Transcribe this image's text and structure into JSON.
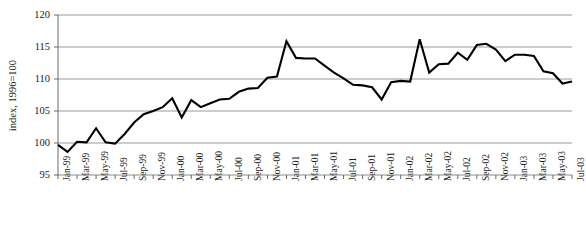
{
  "chart_data": {
    "type": "line",
    "title": "",
    "xlabel": "",
    "ylabel": "index, 1996=100",
    "ylim": [
      95,
      120
    ],
    "ytick_labels": [
      "120",
      "115",
      "110",
      "105",
      "100",
      "95"
    ],
    "ytick_values": [
      120,
      115,
      110,
      105,
      100,
      95
    ],
    "grid": true,
    "legend": "none",
    "x_tick_interval_months": 2,
    "x_tick_labels": [
      "Jan-99",
      "Mar-99",
      "May-99",
      "Jul-99",
      "Sep-99",
      "Nov-99",
      "Jan-00",
      "Mar-00",
      "May-00",
      "Jul-00",
      "Sep-00",
      "Nov-00",
      "Jan-01",
      "Mar-01",
      "May-01",
      "Jul-01",
      "Sep-01",
      "Nov-01",
      "Jan-02",
      "Mar-02",
      "May-02",
      "Jul-02",
      "Sep-02",
      "Nov-02",
      "Jan-03",
      "Mar-03",
      "May-03",
      "Jul-03"
    ],
    "x": [
      "Jan-99",
      "Feb-99",
      "Mar-99",
      "Apr-99",
      "May-99",
      "Jun-99",
      "Jul-99",
      "Aug-99",
      "Sep-99",
      "Oct-99",
      "Nov-99",
      "Dec-99",
      "Jan-00",
      "Feb-00",
      "Mar-00",
      "Apr-00",
      "May-00",
      "Jun-00",
      "Jul-00",
      "Aug-00",
      "Sep-00",
      "Oct-00",
      "Nov-00",
      "Dec-00",
      "Jan-01",
      "Feb-01",
      "Mar-01",
      "Apr-01",
      "May-01",
      "Jun-01",
      "Jul-01",
      "Aug-01",
      "Sep-01",
      "Oct-01",
      "Nov-01",
      "Dec-01",
      "Jan-02",
      "Feb-02",
      "Mar-02",
      "Apr-02",
      "May-02",
      "Jun-02",
      "Jul-02",
      "Aug-02",
      "Sep-02",
      "Oct-02",
      "Nov-02",
      "Dec-02",
      "Jan-03",
      "Feb-03",
      "Mar-03",
      "Apr-03",
      "May-03",
      "Jun-03",
      "Jul-03"
    ],
    "values": [
      99.7,
      98.6,
      100.2,
      100.1,
      102.3,
      100.1,
      99.9,
      101.4,
      103.2,
      104.5,
      105.0,
      105.6,
      107.0,
      104.0,
      106.7,
      105.6,
      106.2,
      106.8,
      106.9,
      108.0,
      108.5,
      108.6,
      110.2,
      110.4,
      115.9,
      113.3,
      113.2,
      113.2,
      112.1,
      111.0,
      110.1,
      109.1,
      109.0,
      108.7,
      106.8,
      109.5,
      109.7,
      109.6,
      116.2,
      111.0,
      112.3,
      112.4,
      114.1,
      113.0,
      115.3,
      115.5,
      114.6,
      112.8,
      113.8,
      113.8,
      113.6,
      111.2,
      110.9,
      109.3,
      109.6
    ],
    "series_name": "index",
    "line_color": "#000000",
    "grid_color": "#808080",
    "axis_color": "#595959"
  }
}
